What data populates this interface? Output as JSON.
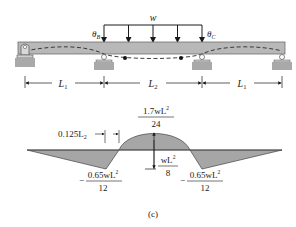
{
  "figure": {
    "caption": "(c)",
    "beam": {
      "load_label": "w",
      "rotation_labels": {
        "left": "θ",
        "left_sub": "B",
        "right": "θ",
        "right_sub": "C"
      },
      "num_load_arrows": 5,
      "spans": [
        {
          "label": "L",
          "sub": "1"
        },
        {
          "label": "L",
          "sub": "2"
        },
        {
          "label": "L",
          "sub": "1"
        }
      ],
      "supports": [
        "pin",
        "roller",
        "roller",
        "roller"
      ],
      "colors": {
        "beam": "#b8b8b8",
        "beam_stroke": "#6e6e6e",
        "support": "#a9a9a9"
      }
    },
    "moment_diagram": {
      "fill_color": "#a6a6a6",
      "peak_positive": {
        "num": "1.7wL",
        "sup": "2",
        "sub": "2",
        "den": "24"
      },
      "simple_span": {
        "num": "wL",
        "sup": "2",
        "sub": "2",
        "den": "8"
      },
      "negative_left": {
        "sign": "−",
        "num": "0.65wL",
        "sup": "2",
        "sub": "2",
        "den": "12"
      },
      "negative_right": {
        "sign": "−",
        "num": "0.65wL",
        "sup": "2",
        "sub": "2",
        "den": "12"
      },
      "inflection_label": {
        "text": "0.125L",
        "sub": "2"
      }
    }
  }
}
